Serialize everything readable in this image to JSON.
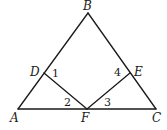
{
  "diagram": {
    "points": {
      "A": {
        "label": "A",
        "x": 18,
        "y": 109,
        "lx": 10,
        "ly": 122
      },
      "B": {
        "label": "B",
        "x": 88,
        "y": 13,
        "lx": 83,
        "ly": 10
      },
      "C": {
        "label": "C",
        "x": 156,
        "y": 109,
        "lx": 152,
        "ly": 122
      },
      "D": {
        "label": "D",
        "x": 44,
        "y": 73,
        "lx": 30,
        "ly": 76
      },
      "E": {
        "label": "E",
        "x": 130,
        "y": 73,
        "lx": 134,
        "ly": 76
      },
      "F": {
        "label": "F",
        "x": 87,
        "y": 109,
        "lx": 81,
        "ly": 122
      }
    },
    "segments": [
      {
        "from": "A",
        "to": "B"
      },
      {
        "from": "B",
        "to": "C"
      },
      {
        "from": "A",
        "to": "C"
      },
      {
        "from": "D",
        "to": "F"
      },
      {
        "from": "E",
        "to": "F"
      }
    ],
    "angles": [
      {
        "label": "1",
        "x": 52,
        "y": 77
      },
      {
        "label": "2",
        "x": 64,
        "y": 106
      },
      {
        "label": "3",
        "x": 104,
        "y": 106
      },
      {
        "label": "4",
        "x": 114,
        "y": 76
      }
    ],
    "stroke_color": "#1a1a1a"
  }
}
